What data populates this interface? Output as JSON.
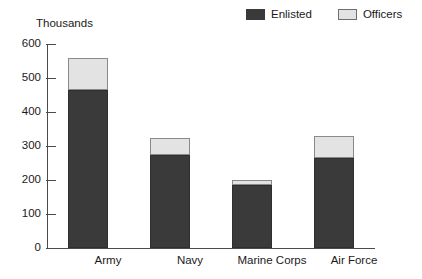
{
  "chart_data": {
    "type": "bar",
    "stacked": true,
    "title": "",
    "subtitle": "",
    "xlabel": "",
    "ylabel": "Thousands",
    "unit_caption": "Thousands",
    "categories": [
      "Army",
      "Navy",
      "Marine Corps",
      "Air Force"
    ],
    "series": [
      {
        "name": "Enlisted",
        "color": "#3a3a3a",
        "values": [
          465,
          275,
          185,
          265
        ]
      },
      {
        "name": "Officers",
        "color": "#e3e3e3",
        "values": [
          95,
          50,
          15,
          65
        ]
      }
    ],
    "totals": [
      560,
      325,
      200,
      330
    ],
    "ylim": [
      0,
      600
    ],
    "ytick_values": [
      0,
      100,
      200,
      300,
      400,
      500,
      600
    ],
    "ytick_labels": [
      "0",
      "100",
      "200",
      "300",
      "400",
      "500",
      "600"
    ],
    "grid": false,
    "legend_position": "top-right",
    "legend_entries": [
      "Enlisted",
      "Officers"
    ]
  },
  "legend": {
    "items": [
      {
        "label": "Enlisted",
        "swatch": "enlisted-swatch"
      },
      {
        "label": "Officers",
        "swatch": "officers-swatch"
      }
    ]
  },
  "axis": {
    "unit_caption": "Thousands"
  }
}
